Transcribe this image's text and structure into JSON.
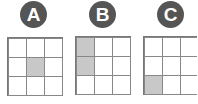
{
  "panels": [
    {
      "label": "A",
      "shaded": [
        [
          1,
          1
        ]
      ]
    },
    {
      "label": "B",
      "shaded": [
        [
          0,
          0
        ],
        [
          1,
          0
        ]
      ]
    },
    {
      "label": "C",
      "shaded": [
        [
          2,
          0
        ]
      ]
    }
  ],
  "colors": {
    "badge": "#555555",
    "shade": "#c8c8c8",
    "line": "#888888"
  }
}
